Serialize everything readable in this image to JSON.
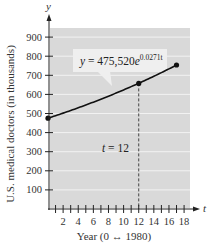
{
  "chart_data": {
    "type": "line",
    "title": "",
    "xlabel": "Year (0 ↔ 1980)",
    "ylabel": "U.S. medical doctors (in thousands)",
    "x_axis_name": "t",
    "y_axis_name": "y",
    "xlim": [
      0,
      19
    ],
    "ylim": [
      0,
      950
    ],
    "x_ticks": [
      2,
      4,
      6,
      8,
      10,
      12,
      14,
      16,
      18
    ],
    "x_tick_labels": [
      "2",
      "4",
      "6",
      "8",
      "10",
      "12",
      "14",
      "16",
      "18"
    ],
    "y_ticks": [
      100,
      200,
      300,
      400,
      500,
      600,
      700,
      800,
      900
    ],
    "y_tick_labels": [
      "100",
      "200",
      "300",
      "400",
      "500",
      "600",
      "700",
      "800",
      "900"
    ],
    "grid": true,
    "series": [
      {
        "name": "y = 475,520e^(0.0271t)",
        "x": [
          0,
          2,
          4,
          6,
          8,
          10,
          12,
          14,
          16,
          17
        ],
        "values": [
          475.5,
          501.9,
          529.8,
          559.2,
          590.3,
          623.0,
          657.6,
          694.2,
          732.7,
          753.9
        ]
      }
    ],
    "marked_points": [
      {
        "t": 0,
        "y": 475.5
      },
      {
        "t": 12,
        "y": 657.6
      },
      {
        "t": 17,
        "y": 753.9
      }
    ],
    "annotations": [
      {
        "text_main": "y = 475,520e",
        "text_exp": "0.0271t",
        "type": "callout"
      },
      {
        "text": "t = 12",
        "type": "vertical-dashed-line",
        "x": 12
      }
    ],
    "colors": {
      "plot_bg": "#d9d9d9",
      "grid": "#f2f2f2",
      "line": "#111111",
      "callout_bg": "#efefef"
    }
  }
}
